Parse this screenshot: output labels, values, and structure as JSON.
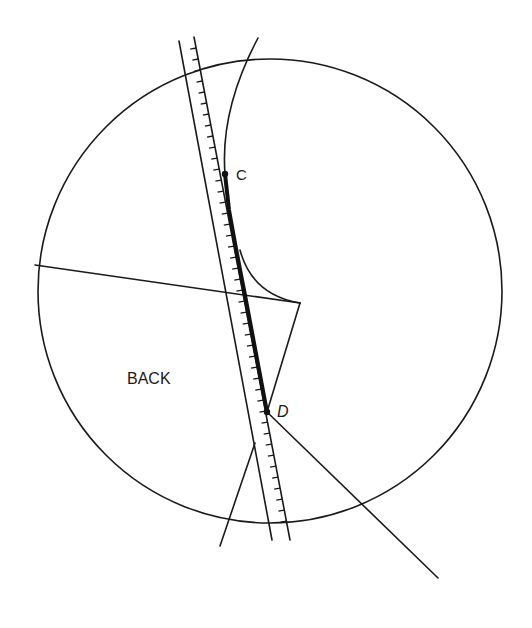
{
  "diagram": {
    "labels": {
      "back": "BACK",
      "point_c": "C",
      "point_d": "D"
    },
    "colors": {
      "line": "#1a1a1a",
      "background": "#ffffff"
    }
  }
}
